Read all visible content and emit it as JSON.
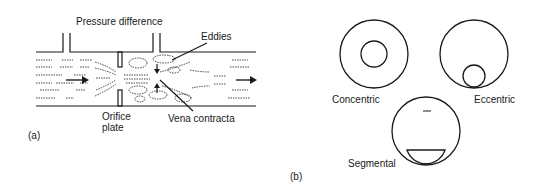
{
  "panel_a": {
    "tag": "(a)",
    "labels": {
      "pressure_difference": "Pressure difference",
      "eddies": "Eddies",
      "orifice_plate_line1": "Orifice",
      "orifice_plate_line2": "plate",
      "vena_contracta": "Vena contracta"
    }
  },
  "panel_b": {
    "tag": "(b)",
    "plates": [
      {
        "label": "Concentric"
      },
      {
        "label": "Eccentric"
      },
      {
        "label": "Segmental"
      }
    ]
  },
  "colors": {
    "stroke": "#1a1a1a",
    "background": "#ffffff"
  }
}
